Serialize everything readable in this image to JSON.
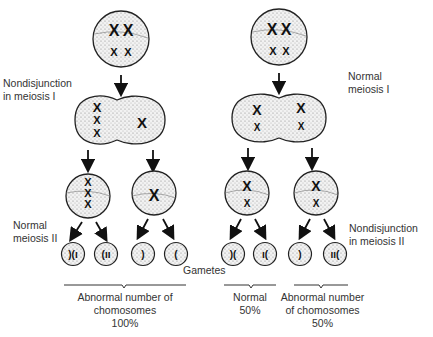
{
  "labels": {
    "nondisjunction_meiosis_1": [
      "Nondisjunction",
      "in meiosis I"
    ],
    "normal_meiosis_1": [
      "Normal",
      "meiosis I"
    ],
    "normal_meiosis_2": [
      "Normal",
      "meiosis II"
    ],
    "nondisjunction_meiosis_2": [
      "Nondisjunction",
      "in meiosis II"
    ],
    "gametes": "Gametes"
  },
  "outcomes": [
    {
      "lines": [
        "Abnormal number of",
        "chomosomes",
        "100%"
      ]
    },
    {
      "lines": [
        "Normal",
        "50%"
      ]
    },
    {
      "lines": [
        "Abnormal number",
        "of chomosomes",
        "50%"
      ]
    }
  ],
  "colors": {
    "stroke": "#222222",
    "fill": "#e6e6e6",
    "text": "#333333"
  }
}
